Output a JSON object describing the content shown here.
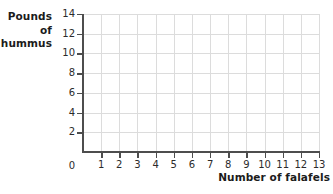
{
  "chart_data": {
    "type": "scatter",
    "title": "",
    "subtitle": "",
    "xlabel": "Number of falafels",
    "ylabel": "Pounds of hummus",
    "ylabel_lines": [
      "Pounds",
      "of",
      "hummus"
    ],
    "x": [],
    "y": [],
    "series": [],
    "xlim": [
      0,
      13
    ],
    "ylim": [
      0,
      14
    ],
    "xticks": [
      0,
      1,
      2,
      3,
      4,
      5,
      6,
      7,
      8,
      9,
      10,
      11,
      12,
      13
    ],
    "xticklabels": [
      "0",
      "1",
      "2",
      "3",
      "4",
      "5",
      "6",
      "7",
      "8",
      "9",
      "10",
      "11",
      "12",
      "13"
    ],
    "yticks": [
      2,
      4,
      6,
      8,
      10,
      12,
      14
    ],
    "yticklabels": [
      "2",
      "4",
      "6",
      "8",
      "10",
      "12",
      "14"
    ],
    "y_origin_label": "0",
    "grid": true,
    "grid_x_step": 1,
    "grid_y_step": 2,
    "legend": null,
    "annotations": [],
    "colors": {
      "background": "#ffffff",
      "gridline": "#dcdcdc",
      "axis": "#4d4d4d",
      "tick_text": "#2b2b2b",
      "axis_title_text": "#1b1b1b"
    }
  }
}
